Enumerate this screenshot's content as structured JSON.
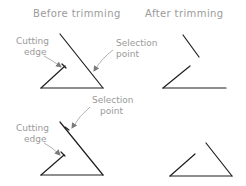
{
  "titles": {
    "before": "Before trimming",
    "after": "After trimming"
  },
  "top_example": {
    "cutting_edge_label": [
      "Cutting",
      "edge"
    ],
    "selection_point_label": [
      "Selection",
      "point"
    ]
  },
  "bottom_example": {
    "cutting_edge_label": [
      "Cutting",
      "edge"
    ],
    "selection_point_label": [
      "Selection",
      "point"
    ]
  },
  "colors": {
    "geometry": "#1e1e1e",
    "annotation": "#9a9a9a"
  }
}
